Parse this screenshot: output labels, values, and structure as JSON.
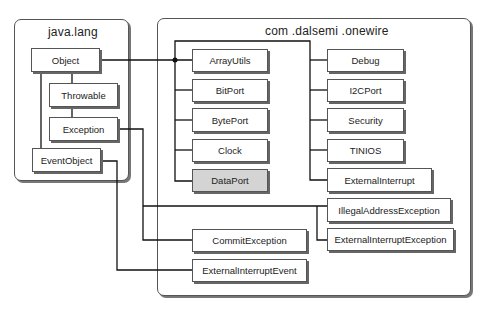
{
  "packages": {
    "java_lang": {
      "title": "java.lang"
    },
    "onewire": {
      "title": "com .dalsemi .onewire"
    }
  },
  "classes": {
    "object": "Object",
    "throwable": "Throwable",
    "exception": "Exception",
    "event_object": "EventObject",
    "array_utils": "ArrayUtils",
    "bit_port": "BitPort",
    "byte_port": "BytePort",
    "clock": "Clock",
    "data_port": "DataPort",
    "debug": "Debug",
    "i2c_port": "I2CPort",
    "security": "Security",
    "tinios": "TINIOS",
    "external_interrupt": "ExternalInterrupt",
    "illegal_address_exception": "IllegalAddressException",
    "external_interrupt_exception": "ExternalInterruptException",
    "commit_exception": "CommitException",
    "external_interrupt_event": "ExternalInterruptEvent"
  },
  "colors": {
    "highlight": "#d4d4d4",
    "line": "#111111",
    "border": "#555555"
  }
}
